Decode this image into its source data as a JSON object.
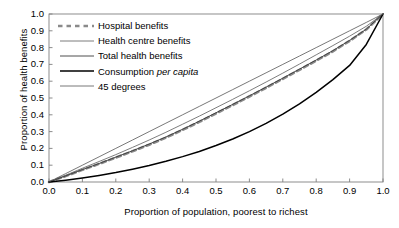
{
  "chart_data": {
    "type": "line",
    "title": "",
    "xlabel": "Proportion of population, poorest to richest",
    "ylabel": "Proportion of health benefits",
    "xlim": [
      0.0,
      1.0
    ],
    "ylim": [
      0.0,
      1.0
    ],
    "grid": false,
    "legend_position": "upper-left-inside",
    "xticks": [
      "0.0",
      "0.1",
      "0.2",
      "0.3",
      "0.4",
      "0.5",
      "0.6",
      "0.7",
      "0.8",
      "0.9",
      "1.0"
    ],
    "yticks": [
      "0.0",
      "0.1",
      "0.2",
      "0.3",
      "0.4",
      "0.5",
      "0.6",
      "0.7",
      "0.8",
      "0.9",
      "1.0"
    ],
    "xtick_values": [
      0.0,
      0.1,
      0.2,
      0.3,
      0.4,
      0.5,
      0.6,
      0.7,
      0.8,
      0.9,
      1.0
    ],
    "ytick_values": [
      0.0,
      0.1,
      0.2,
      0.3,
      0.4,
      0.5,
      0.6,
      0.7,
      0.8,
      0.9,
      1.0
    ],
    "x": [
      0.0,
      0.05,
      0.1,
      0.15,
      0.2,
      0.25,
      0.3,
      0.35,
      0.4,
      0.45,
      0.5,
      0.55,
      0.6,
      0.65,
      0.7,
      0.75,
      0.8,
      0.85,
      0.9,
      0.95,
      1.0
    ],
    "series": [
      {
        "name": "Hospital benefits",
        "style": "dashed",
        "color": "#8a8a8a",
        "width": 2.6,
        "values": [
          0.0,
          0.035,
          0.072,
          0.108,
          0.145,
          0.183,
          0.222,
          0.264,
          0.31,
          0.358,
          0.408,
          0.458,
          0.509,
          0.561,
          0.614,
          0.668,
          0.722,
          0.778,
          0.84,
          0.908,
          1.0
        ]
      },
      {
        "name": "Health centre benefits",
        "style": "solid",
        "color": "#6e6e6e",
        "width": 0.9,
        "values": [
          0.0,
          0.04,
          0.082,
          0.122,
          0.163,
          0.206,
          0.25,
          0.296,
          0.344,
          0.392,
          0.442,
          0.492,
          0.543,
          0.595,
          0.648,
          0.702,
          0.757,
          0.812,
          0.868,
          0.927,
          1.0
        ]
      },
      {
        "name": "Total health benefits",
        "style": "solid",
        "color": "#3a3a3a",
        "width": 0.9,
        "values": [
          0.0,
          0.036,
          0.074,
          0.11,
          0.148,
          0.186,
          0.226,
          0.268,
          0.314,
          0.362,
          0.412,
          0.462,
          0.513,
          0.565,
          0.618,
          0.672,
          0.726,
          0.782,
          0.843,
          0.91,
          1.0
        ]
      },
      {
        "name": "Consumption per capita",
        "style": "solid",
        "color": "#000000",
        "width": 1.5,
        "values": [
          0.0,
          0.011,
          0.024,
          0.039,
          0.056,
          0.076,
          0.098,
          0.123,
          0.151,
          0.182,
          0.217,
          0.256,
          0.3,
          0.349,
          0.404,
          0.465,
          0.533,
          0.609,
          0.694,
          0.819,
          1.0
        ]
      },
      {
        "name": "45 degrees",
        "style": "solid",
        "color": "#555555",
        "width": 0.8,
        "values": [
          0.0,
          0.05,
          0.1,
          0.15,
          0.2,
          0.25,
          0.3,
          0.35,
          0.4,
          0.45,
          0.5,
          0.55,
          0.6,
          0.65,
          0.7,
          0.75,
          0.8,
          0.85,
          0.9,
          0.95,
          1.0
        ]
      }
    ]
  },
  "legend": {
    "items": [
      {
        "label_pre": "Hospital benefits",
        "label_italic": "",
        "label_post": ""
      },
      {
        "label_pre": "Health centre benefits",
        "label_italic": "",
        "label_post": ""
      },
      {
        "label_pre": "Total health benefits",
        "label_italic": "",
        "label_post": ""
      },
      {
        "label_pre": "Consumption ",
        "label_italic": "per capita",
        "label_post": ""
      },
      {
        "label_pre": "45 degrees",
        "label_italic": "",
        "label_post": ""
      }
    ]
  }
}
